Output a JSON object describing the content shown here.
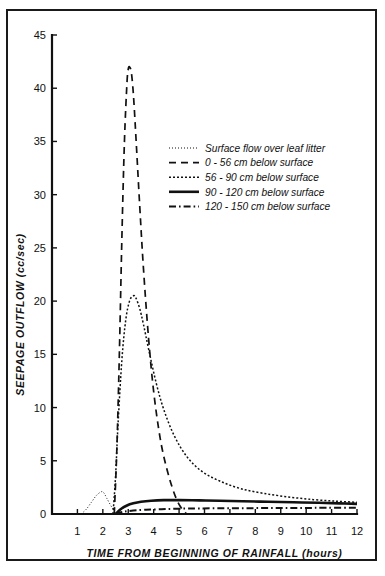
{
  "figure": {
    "border_color": "#1a1a1a",
    "ink_color": "#111111",
    "background": "#ffffff"
  },
  "chart_data": {
    "type": "line",
    "title": "",
    "subtitle": "",
    "xlabel": "TIME  FROM  BEGINNING  OF  RAINFALL (hours)",
    "ylabel": "SEEPAGE  OUTFLOW  (cc/sec)",
    "xlim": [
      0,
      12
    ],
    "ylim": [
      0,
      45
    ],
    "xticks": [
      1,
      2,
      3,
      4,
      5,
      6,
      7,
      8,
      9,
      10,
      11,
      12
    ],
    "xtick_labels": [
      "1",
      "2",
      "3",
      "4",
      "5",
      "6",
      "7",
      "8",
      "9",
      "10",
      "11",
      "12"
    ],
    "yticks": [
      0,
      5,
      10,
      15,
      20,
      25,
      30,
      35,
      40,
      45
    ],
    "ytick_labels": [
      "0",
      "5",
      "10",
      "15",
      "20",
      "25",
      "30",
      "35",
      "40",
      "45"
    ],
    "grid": false,
    "legend_position": "upper-right-inside",
    "series": [
      {
        "name": "Surface flow over leaf litter",
        "style": "fine-dotted",
        "dasharray": "1,2",
        "width": 1.0,
        "x": [
          1.15,
          1.35,
          1.55,
          1.75,
          1.95,
          2.05,
          2.15,
          2.3,
          2.45,
          2.5
        ],
        "values": [
          0,
          0.45,
          1.1,
          1.75,
          2.1,
          1.95,
          1.5,
          0.85,
          0.25,
          0
        ]
      },
      {
        "name": "0 - 56 cm below surface",
        "style": "long-dashed",
        "dasharray": "7,5",
        "width": 1.7,
        "x": [
          2.45,
          2.55,
          2.65,
          2.75,
          2.85,
          2.95,
          3.0,
          3.05,
          3.12,
          3.2,
          3.3,
          3.45,
          3.6,
          3.8,
          4.0,
          4.25,
          4.5,
          4.8,
          5.05,
          5.3
        ],
        "values": [
          0,
          6.0,
          15.0,
          26.0,
          35.0,
          40.5,
          41.8,
          42.0,
          41.5,
          39.5,
          35.5,
          29.0,
          23.0,
          16.5,
          11.5,
          7.2,
          4.4,
          2.0,
          0.7,
          0
        ]
      },
      {
        "name": "56 - 90 cm below surface",
        "style": "dotted",
        "dasharray": "2,2",
        "width": 1.5,
        "x": [
          2.4,
          2.5,
          2.6,
          2.75,
          2.9,
          3.05,
          3.2,
          3.3,
          3.45,
          3.6,
          3.8,
          4.1,
          4.4,
          4.8,
          5.3,
          5.9,
          6.6,
          7.4,
          8.3,
          9.3,
          10.3,
          11.2,
          12.0
        ],
        "values": [
          0,
          3.5,
          8.5,
          14.5,
          18.2,
          20.0,
          20.5,
          20.3,
          19.3,
          17.8,
          15.5,
          12.3,
          9.8,
          7.4,
          5.4,
          4.0,
          3.1,
          2.4,
          1.95,
          1.6,
          1.35,
          1.2,
          1.1
        ]
      },
      {
        "name": "90 - 120 cm below surface",
        "style": "solid",
        "dasharray": "",
        "width": 2.6,
        "x": [
          2.5,
          2.7,
          2.95,
          3.2,
          3.5,
          3.9,
          4.4,
          5.0,
          5.8,
          6.6,
          7.5,
          8.5,
          9.5,
          10.5,
          11.3,
          12.0
        ],
        "values": [
          0,
          0.45,
          0.8,
          1.0,
          1.15,
          1.25,
          1.3,
          1.3,
          1.28,
          1.25,
          1.2,
          1.15,
          1.1,
          1.05,
          1.0,
          0.95
        ]
      },
      {
        "name": "120 - 150 cm below surface",
        "style": "dash-dot",
        "dasharray": "7,3,1.6,3",
        "width": 2.0,
        "x": [
          2.5,
          2.8,
          3.2,
          3.7,
          4.3,
          5.0,
          5.8,
          6.8,
          7.8,
          8.8,
          9.8,
          10.8,
          12.0
        ],
        "values": [
          0,
          0.2,
          0.32,
          0.4,
          0.45,
          0.5,
          0.52,
          0.54,
          0.55,
          0.56,
          0.57,
          0.58,
          0.58
        ]
      }
    ],
    "legend_entries": [
      "Surface flow over leaf litter",
      "0 - 56 cm below surface",
      "56 - 90 cm below surface",
      "90 - 120 cm below surface",
      "120 - 150 cm below surface"
    ]
  }
}
